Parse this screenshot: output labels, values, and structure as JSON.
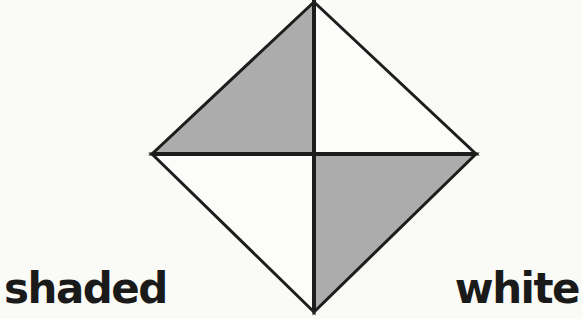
{
  "figure": {
    "quadrants": [
      {
        "position": "top-left",
        "fill": "shaded"
      },
      {
        "position": "top-right",
        "fill": "white"
      },
      {
        "position": "bottom-left",
        "fill": "white"
      },
      {
        "position": "bottom-right",
        "fill": "shaded"
      }
    ],
    "labels": {
      "bottom_left": "shaded",
      "bottom_right": "white"
    },
    "colors": {
      "shaded": "#acacac",
      "white": "#fcfcfa",
      "line": "#1d1d1d",
      "background": "#fafaf7",
      "label_text": "#1a1a1a"
    }
  }
}
